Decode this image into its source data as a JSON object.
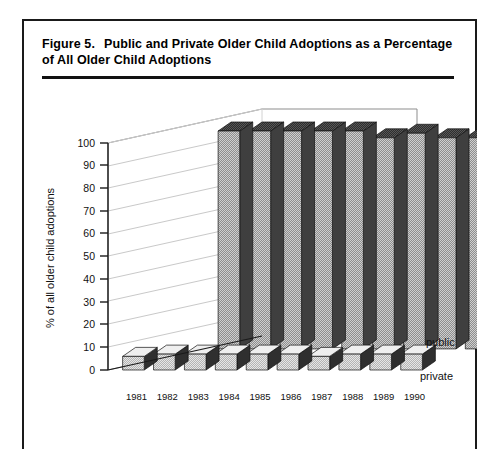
{
  "figure": {
    "number_label": "Figure 5.",
    "title": "Public and Private Older Child Adoptions as a Percentage of All Older Child Adoptions"
  },
  "chart_data": {
    "type": "bar",
    "render": "3d-grouped-rows",
    "title": "Public and Private Older Child Adoptions as a Percentage of All Older Child Adoptions",
    "xlabel": "",
    "ylabel": "% of all older child adoptions",
    "ylim": [
      0,
      100
    ],
    "yticks": [
      0,
      10,
      20,
      30,
      40,
      50,
      60,
      70,
      80,
      90,
      100
    ],
    "categories": [
      "1981",
      "1982",
      "1983",
      "1984",
      "1985",
      "1986",
      "1987",
      "1988",
      "1989",
      "1990"
    ],
    "grid": false,
    "legend_position": "right",
    "series": [
      {
        "name": "public",
        "values": [
          96,
          96,
          96,
          96,
          96,
          93,
          95,
          93,
          93,
          93
        ]
      },
      {
        "name": "private",
        "values": [
          6,
          7,
          7,
          7,
          7,
          7,
          6,
          7,
          7,
          7
        ]
      }
    ]
  },
  "axis": {
    "y_label": "% of all older child adoptions",
    "y_ticks": [
      "100",
      "90",
      "80",
      "70",
      "60",
      "50",
      "40",
      "30",
      "20",
      "10",
      "0"
    ],
    "x_ticks": [
      "1981",
      "1982",
      "1983",
      "1984",
      "1985",
      "1986",
      "1987",
      "1988",
      "1989",
      "1990"
    ]
  },
  "legend": {
    "public_label": "public",
    "private_label": "private"
  },
  "colors": {
    "bar_face": "#bdbdbd",
    "bar_side": "#4a4a4a",
    "bar_top": "#5c5c5c",
    "small_face": "#d8d8d8",
    "small_top": "#e8e8e8",
    "axis": "#1a1a1a",
    "depth_line": "#b9b9b9"
  }
}
